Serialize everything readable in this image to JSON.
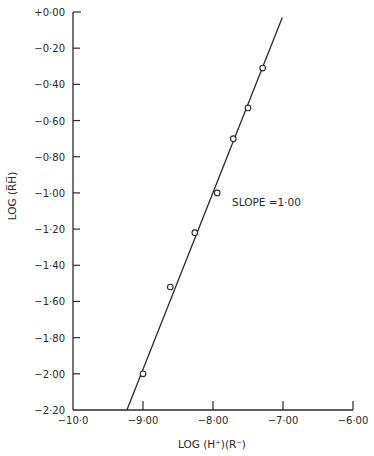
{
  "chart_data": {
    "type": "scatter",
    "title": "",
    "xlabel": "LOG (H⁺)(R⁻)",
    "ylabel": "LOG (R̅H̅)",
    "xlim": [
      -10.0,
      -6.0
    ],
    "ylim": [
      -2.2,
      0.0
    ],
    "grid": false,
    "legend": null,
    "x_ticks": [
      -10.0,
      -9.0,
      -8.0,
      -7.0,
      -6.0
    ],
    "x_tick_labels": [
      "-10.0",
      "-9.00",
      "-8.00",
      "-7.00",
      "-6.00"
    ],
    "y_ticks": [
      0.0,
      -0.2,
      -0.4,
      -0.6,
      -0.8,
      -1.0,
      -1.2,
      -1.4,
      -1.6,
      -1.8,
      -2.0,
      -2.2
    ],
    "y_tick_labels": [
      "+0.00",
      "-0.20",
      "-0.40",
      "-0.60",
      "-0.80",
      "-1.00",
      "-1.20",
      "-1.40",
      "-1.60",
      "-1.80",
      "-2.00",
      "-2.20"
    ],
    "series": [
      {
        "name": "measured",
        "marker": "open-circle",
        "points": [
          {
            "x": -9.0,
            "y": -2.0
          },
          {
            "x": -8.61,
            "y": -1.52
          },
          {
            "x": -8.26,
            "y": -1.22
          },
          {
            "x": -7.94,
            "y": -1.0
          },
          {
            "x": -7.71,
            "y": -0.7
          },
          {
            "x": -7.5,
            "y": -0.53
          },
          {
            "x": -7.29,
            "y": -0.31
          }
        ]
      },
      {
        "name": "fit",
        "style": "line",
        "points": [
          {
            "x": -9.23,
            "y": -2.2
          },
          {
            "x": -7.01,
            "y": -0.03
          }
        ]
      }
    ],
    "annotations": [
      {
        "text": "SLOPE =1.00",
        "x": -7.7,
        "y": -1.0
      }
    ]
  },
  "labels": {
    "xlabel": "LOG (H⁺)(R⁻)",
    "ylabel": "LOG (R̅H̅)",
    "annotation": "SLOPE =1·00"
  }
}
